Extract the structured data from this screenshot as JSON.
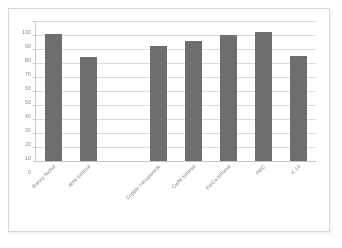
{
  "chart_data": {
    "type": "bar",
    "title": "",
    "subtitle": "",
    "xlabel": "",
    "ylabel": "",
    "ylim": [
      0,
      100
    ],
    "ytick_step": 10,
    "yticks": [
      "100",
      "90",
      "80",
      "70",
      "60",
      "50",
      "40",
      "30",
      "20",
      "10",
      "0"
    ],
    "grid": true,
    "legend": false,
    "legend_position": "none",
    "bar_color": "#6e6e6e",
    "gridline_color": "#dcdcdc",
    "axis_color": "#c9c9c9",
    "categories": [
      "Raney Nickel",
      "Al/Ni bimetal",
      "",
      "Copper nanoparticle",
      "Cu/Ni bimetal",
      "Fe/Cu bimetal",
      "Pd/C",
      "K 10"
    ],
    "values": [
      91,
      74,
      null,
      82,
      86,
      90,
      92,
      75
    ]
  },
  "axes": {
    "y_axis_name": "y-axis",
    "x_axis_name": "x-axis"
  }
}
